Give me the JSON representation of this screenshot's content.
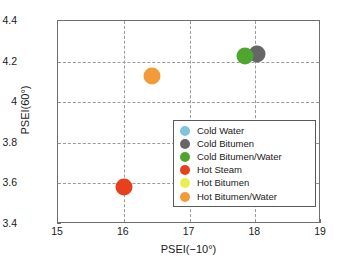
{
  "chart_data": {
    "type": "scatter",
    "title": "",
    "xlabel": "PSEI(−10°)",
    "ylabel": "PSEI(60°)",
    "xlim": [
      15,
      19
    ],
    "ylim": [
      3.4,
      4.4
    ],
    "xticks": [
      "15",
      "16",
      "17",
      "18",
      "19"
    ],
    "yticks": [
      "3.4",
      "3.6",
      "3.8",
      "4",
      "4.2",
      "4.4"
    ],
    "xtick_values": [
      15,
      16,
      17,
      18,
      19
    ],
    "ytick_values": [
      3.4,
      3.6,
      3.8,
      4.0,
      4.2,
      4.4
    ],
    "grid": true,
    "grid_style": "dashed",
    "legend_position": "lower-right-inside",
    "series": [
      {
        "name": "Cold Water",
        "color": "#7ec5dc",
        "points": []
      },
      {
        "name": "Cold Bitumen",
        "color": "#666666",
        "points": [
          {
            "x": 18.02,
            "y": 4.235
          }
        ]
      },
      {
        "name": "Cold Bitumen/Water",
        "color": "#4ea62f",
        "points": [
          {
            "x": 17.85,
            "y": 4.228
          }
        ]
      },
      {
        "name": "Hot Steam",
        "color": "#e8401c",
        "points": [
          {
            "x": 16.0,
            "y": 3.58
          }
        ]
      },
      {
        "name": "Hot Bitumen",
        "color": "#e8ef55",
        "points": []
      },
      {
        "name": "Hot Bitumen/Water",
        "color": "#f29b38",
        "points": [
          {
            "x": 16.43,
            "y": 4.13
          }
        ]
      }
    ]
  }
}
